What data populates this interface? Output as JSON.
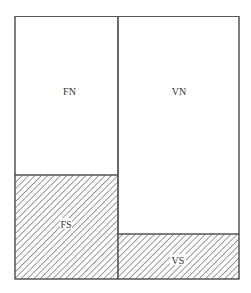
{
  "diagram": {
    "type": "block-partition",
    "regions": [
      {
        "id": "FN",
        "label": "FN",
        "hatched": false
      },
      {
        "id": "VN",
        "label": "VN",
        "hatched": false
      },
      {
        "id": "FS",
        "label": "FS",
        "hatched": true
      },
      {
        "id": "VS",
        "label": "VS",
        "hatched": true
      }
    ],
    "colors": {
      "stroke": "#555555",
      "hatch": "#666666",
      "background": "#ffffff",
      "text": "#333333"
    }
  }
}
